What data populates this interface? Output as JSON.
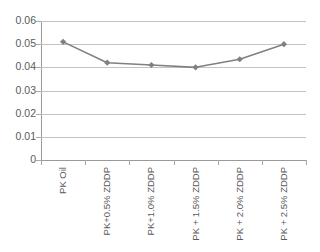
{
  "chart_data": {
    "type": "line",
    "title": "",
    "subtitle": "",
    "xlabel": "",
    "ylabel": "",
    "categories": [
      "PK Oil",
      "PK+0.5% ZDDP",
      "PK+1.0% ZDDP",
      "PK + 1.5% ZDDP",
      "PK + 2.0% ZDDP",
      "PK + 2.5% ZDDP"
    ],
    "values": [
      0.051,
      0.042,
      0.041,
      0.04,
      0.0435,
      0.05
    ],
    "ylim": [
      0,
      0.06
    ],
    "ytick_labels": [
      "0",
      "0.01",
      "0.02",
      "0.03",
      "0.04",
      "0.05",
      "0.06"
    ],
    "ytick_values": [
      0,
      0.01,
      0.02,
      0.03,
      0.04,
      0.05,
      0.06
    ],
    "grid": true,
    "grid_axis": "y",
    "legend": false,
    "legend_position": "none",
    "series": [
      {
        "name": "",
        "values": [
          0.051,
          0.042,
          0.041,
          0.04,
          0.0435,
          0.05
        ],
        "color": "#808080",
        "marker": "diamond"
      }
    ],
    "colors": {
      "line": "#808080",
      "marker": "#808080",
      "gridline": "#c3c3c3",
      "axis": "#9a9a9a",
      "text": "#5a5a5a",
      "background": "#ffffff"
    }
  }
}
